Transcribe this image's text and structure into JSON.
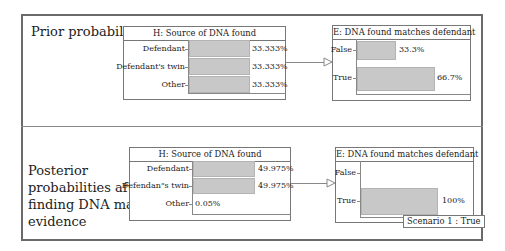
{
  "sections": {
    "prior": {
      "label": "Prior probabilities",
      "source_node": {
        "title": "H: Source of DNA found",
        "rows": [
          {
            "label": "Defendant",
            "value": "33.333%",
            "pct": 33.333
          },
          {
            "label": "Defendant's twin",
            "value": "33.333%",
            "pct": 33.333
          },
          {
            "label": "Other",
            "value": "33.333%",
            "pct": 33.333
          }
        ]
      },
      "evidence_node": {
        "title": "E: DNA found matches defendant",
        "rows": [
          {
            "label": "False",
            "value": "33.3%",
            "pct": 33.3
          },
          {
            "label": "True",
            "value": "66.7%",
            "pct": 66.7
          }
        ]
      }
    },
    "posterior": {
      "label_lines": [
        "Posterior",
        "probabilities after",
        "finding DNA match",
        "evidence"
      ],
      "source_node": {
        "title": "H: Source of DNA found",
        "rows": [
          {
            "label": "Defendant",
            "value": "49.975%",
            "pct": 49.975
          },
          {
            "label": "Defendan\"s twin",
            "value": "49.975%",
            "pct": 49.975
          },
          {
            "label": "Other",
            "value": "0.05%",
            "pct": 0.05
          }
        ]
      },
      "evidence_node": {
        "title": "E: DNA found matches defendant",
        "rows": [
          {
            "label": "False",
            "value": "",
            "pct": 0
          },
          {
            "label": "True",
            "value": "100%",
            "pct": 100
          }
        ],
        "scenario_tag": "Scenario 1 : True"
      }
    }
  },
  "colors": {
    "bar_fill": "#c8c8c8",
    "border": "#777777",
    "outer_border": "#6a6a6a"
  }
}
